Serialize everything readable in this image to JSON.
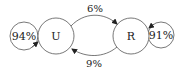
{
  "diagram": {
    "type": "state-transition",
    "nodes": [
      {
        "id": "U",
        "label": "U"
      },
      {
        "id": "R",
        "label": "R"
      }
    ],
    "self_loops": [
      {
        "node": "U",
        "label": "94%"
      },
      {
        "node": "R",
        "label": "91%"
      }
    ],
    "edges": [
      {
        "from": "U",
        "to": "R",
        "label": "6%"
      },
      {
        "from": "R",
        "to": "U",
        "label": "9%"
      }
    ],
    "colors": {
      "stroke": "#444444",
      "text": "#222222",
      "background": "#ffffff"
    }
  }
}
